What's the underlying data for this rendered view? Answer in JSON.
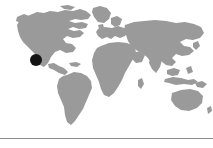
{
  "figure": {
    "kind": "world-locator-map",
    "width": 213,
    "height": 148,
    "background_color": "#ffffff",
    "land_color": "#9a9a9a",
    "ocean_color": "#ffffff",
    "marker": {
      "icon": "location-dot-icon",
      "color": "#141414",
      "shape": "circle",
      "diameter_px": 12,
      "center_x_px": 36,
      "center_y_px": 60,
      "region": "western United States"
    },
    "divider": {
      "color": "#8d8d8d",
      "y_px": 138,
      "thickness_px": 1
    },
    "continents": [
      "North America",
      "South America",
      "Europe",
      "Africa",
      "Asia",
      "Australia"
    ],
    "labels": [],
    "caption": ""
  }
}
